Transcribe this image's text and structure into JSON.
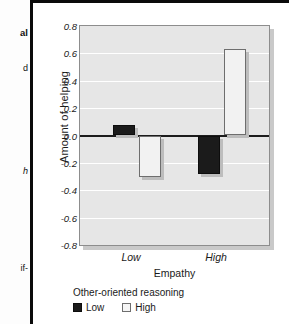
{
  "page_fragments": [
    {
      "text": "al",
      "style": "bold",
      "top": 28
    },
    {
      "text": "d",
      "style": "plain",
      "top": 63
    },
    {
      "text": "h",
      "style": "ital",
      "top": 166
    },
    {
      "text": "if-",
      "style": "plain",
      "top": 263
    }
  ],
  "chart_data": {
    "type": "bar",
    "title": "",
    "xlabel": "Empathy",
    "ylabel": "Amount of helping",
    "categories": [
      "Low",
      "High"
    ],
    "series": [
      {
        "name": "Low",
        "values": [
          0.08,
          -0.28
        ],
        "color": "#1b1b1b"
      },
      {
        "name": "High",
        "values": [
          -0.3,
          0.63
        ],
        "color": "#f2f2f2"
      }
    ],
    "legend_title": "Other-oriented reasoning",
    "legend_position": "bottom-left",
    "ylim": [
      -0.8,
      0.8
    ],
    "ytick_labels": [
      "0.8",
      "0.6",
      "0.4",
      "0.2",
      "0.0",
      "-0.2",
      "-0.4",
      "-0.6",
      "-0.8"
    ],
    "ytick_values": [
      0.8,
      0.6,
      0.4,
      0.2,
      0.0,
      -0.2,
      -0.4,
      -0.6,
      -0.8
    ],
    "grid": true,
    "zero_line": true,
    "plot_background": "#e6e6e6",
    "gridline_color": "#ffffff"
  }
}
